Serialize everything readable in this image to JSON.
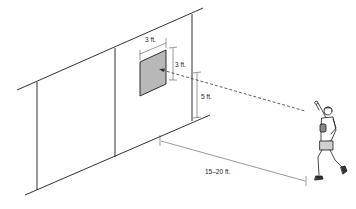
{
  "diagram": {
    "colors": {
      "line": "#1a1a1a",
      "target_fill": "#b8b8b8",
      "dimension": "#333333",
      "background": "#ffffff"
    },
    "labels": {
      "target_width": "3 ft.",
      "target_height": "3 ft.",
      "target_elevation": "5 ft.",
      "throw_distance": "15–20 ft."
    },
    "elements": {
      "wall": "wall-panel",
      "target": "square-target",
      "throw_path": "dashed-throw-line",
      "player": "throwing-player-figure"
    }
  }
}
